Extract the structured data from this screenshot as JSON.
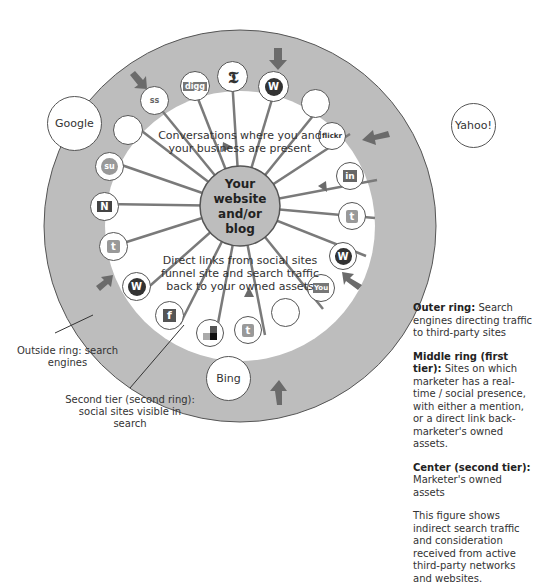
{
  "diagram": {
    "center": {
      "line1": "Your",
      "line2": "website",
      "line3": "and/or",
      "line4": "blog"
    },
    "top_caption": {
      "line1": "Conversations where you and",
      "line2": "your business are present"
    },
    "bottom_caption": {
      "line1": "Direct links from social sites",
      "line2": "funnel site and search traffic",
      "line3": "back to your owned assets"
    },
    "search_engines": [
      {
        "name": "Google"
      },
      {
        "name": "Yahoo!"
      },
      {
        "name": "Bing"
      }
    ],
    "nodes": [
      {
        "icon": "digg-icon",
        "glyph": "digg"
      },
      {
        "icon": "nytimes-icon",
        "glyph": "𝕿"
      },
      {
        "icon": "wordpress-icon",
        "glyph": "W"
      },
      {
        "icon": "empty-node",
        "glyph": ""
      },
      {
        "icon": "flickr-icon",
        "glyph": "flickr"
      },
      {
        "icon": "linkedin-icon",
        "glyph": "in"
      },
      {
        "icon": "twitter-icon",
        "glyph": "t"
      },
      {
        "icon": "wordpress-icon",
        "glyph": "W"
      },
      {
        "icon": "youtube-icon",
        "glyph": "You"
      },
      {
        "icon": "empty-node",
        "glyph": ""
      },
      {
        "icon": "twitter-icon",
        "glyph": "t"
      },
      {
        "icon": "delicious-icon",
        "glyph": ""
      },
      {
        "icon": "facebook-icon",
        "glyph": "f"
      },
      {
        "icon": "wordpress-icon",
        "glyph": "W"
      },
      {
        "icon": "twitter-icon",
        "glyph": "t"
      },
      {
        "icon": "newsvine-icon",
        "glyph": "N"
      },
      {
        "icon": "stumbleupon-icon",
        "glyph": "su"
      },
      {
        "icon": "empty-node",
        "glyph": ""
      },
      {
        "icon": "slideshare-icon",
        "glyph": "ss"
      }
    ],
    "annotations": {
      "outside_ring": {
        "line1": "Outside ring: search",
        "line2": "engines"
      },
      "second_tier": {
        "line1": "Second tier (second ring):",
        "line2": "social sites visible in search"
      }
    },
    "colors": {
      "outer_ring": "#bdbdbd",
      "center": "#bdbdbd",
      "arrow": "#6b6b6b",
      "line": "#7a7a7a"
    }
  },
  "legend": {
    "outer": {
      "title": "Outer ring:",
      "text": " Search engines directing traffic to third-party sites"
    },
    "middle": {
      "title": "Middle ring (first tier):",
      "text": " Sites on which marketer has a real-time / social presence, with either a mention, or a direct link back-marketer's owned assets."
    },
    "center": {
      "title": "Center (second tier):",
      "text": " Marketer's owned assets"
    },
    "note": "This figure shows indirect search traffic and consideration received from active third-party networks and websites."
  }
}
